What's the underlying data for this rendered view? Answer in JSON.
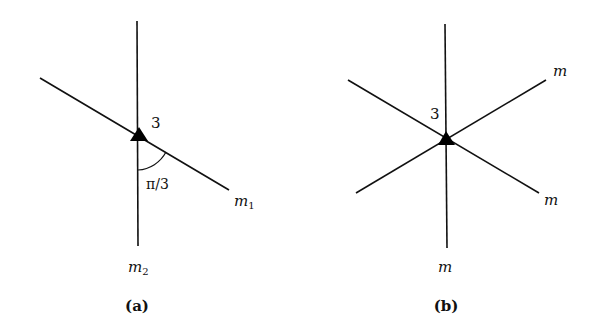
{
  "panel_a": {
    "caption": "(a)",
    "vertex_label": "3",
    "angle_label": "π/3",
    "line_labels": {
      "m1": "m",
      "m1_sub": "1",
      "m2": "m",
      "m2_sub": "2"
    }
  },
  "panel_b": {
    "caption": "(b)",
    "vertex_label": "3",
    "line_labels": [
      "m",
      "m",
      "m"
    ]
  },
  "colors": {
    "stroke": "#111111",
    "background": "#ffffff"
  }
}
